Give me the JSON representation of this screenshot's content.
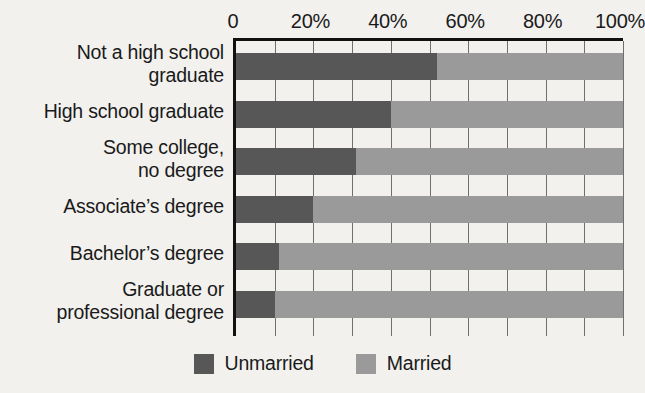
{
  "chart_data": {
    "type": "bar",
    "orientation": "horizontal",
    "stacked": true,
    "normalized": true,
    "title": "",
    "subtitle": "",
    "xlabel": "",
    "ylabel": "",
    "xlim": [
      0,
      100
    ],
    "xticks": [
      0,
      20,
      40,
      60,
      80,
      100
    ],
    "xticklabels": [
      "0",
      "20%",
      "40%",
      "60%",
      "80%",
      "100%"
    ],
    "grid": true,
    "grid_axis": "x",
    "legend_position": "bottom-center",
    "categories": [
      "Not a high school graduate",
      "High school graduate",
      "Some college, no degree",
      "Associate’s degree",
      "Bachelor’s degree",
      "Graduate or professional degree"
    ],
    "category_lines": [
      [
        "Not a high school",
        "graduate"
      ],
      [
        "High school graduate"
      ],
      [
        "Some college,",
        "no degree"
      ],
      [
        "Associate’s degree"
      ],
      [
        "Bachelor’s degree"
      ],
      [
        "Graduate or",
        "professional degree"
      ]
    ],
    "series": [
      {
        "name": "Unmarried",
        "color": "#575757",
        "values": [
          52,
          40,
          31,
          20,
          11,
          10
        ]
      },
      {
        "name": "Married",
        "color": "#9a9a9a",
        "values": [
          48,
          60,
          69,
          80,
          89,
          90
        ]
      }
    ]
  },
  "legend": {
    "items": [
      {
        "label": "Unmarried",
        "color": "#575757"
      },
      {
        "label": "Married",
        "color": "#9a9a9a"
      }
    ]
  },
  "axis": {
    "tick_labels": [
      "0",
      "20%",
      "40%",
      "60%",
      "80%",
      "100%"
    ]
  }
}
